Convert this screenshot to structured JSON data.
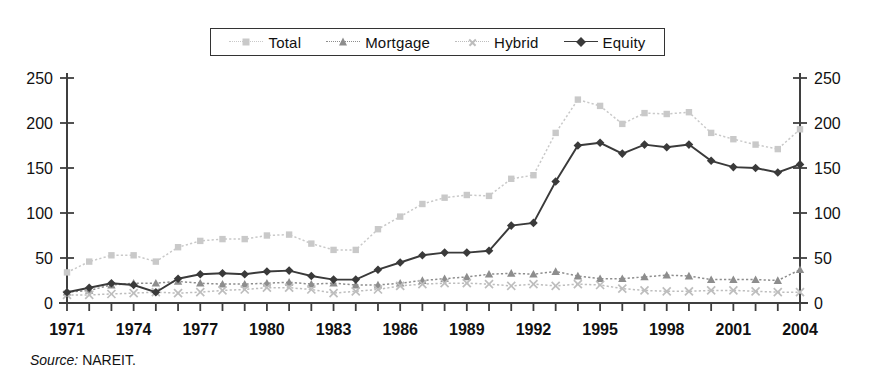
{
  "legend": {
    "items": [
      {
        "label": "Total",
        "marker": "square-marker",
        "color": "#c9c9c9",
        "line": "dotted"
      },
      {
        "label": "Mortgage",
        "marker": "triangle-marker",
        "color": "#8d8d8d",
        "line": "dotted"
      },
      {
        "label": "Hybrid",
        "marker": "x-marker",
        "color": "#bdbdbd",
        "line": "dotted"
      },
      {
        "label": "Equity",
        "marker": "diamond-marker",
        "color": "#3a3a3a",
        "line": "solid"
      }
    ]
  },
  "source": {
    "prefix": "Source:",
    "text": "NAREIT."
  },
  "axes": {
    "left_ticks": [
      "0",
      "50",
      "100",
      "150",
      "200",
      "250"
    ],
    "right_ticks": [
      "0",
      "50",
      "100",
      "150",
      "200",
      "250"
    ],
    "x_ticks": [
      "1971",
      "1974",
      "1977",
      "1980",
      "1983",
      "1986",
      "1989",
      "1992",
      "1995",
      "1998",
      "2001",
      "2004"
    ]
  },
  "chart_data": {
    "type": "line",
    "title": "",
    "xlabel": "",
    "ylabel": "",
    "ylim": [
      0,
      250
    ],
    "ytick_step": 50,
    "grid": false,
    "legend_position": "top-center",
    "dual_axis": true,
    "x": [
      1971,
      1972,
      1973,
      1974,
      1975,
      1976,
      1977,
      1978,
      1979,
      1980,
      1981,
      1982,
      1983,
      1984,
      1985,
      1986,
      1987,
      1988,
      1989,
      1990,
      1991,
      1992,
      1993,
      1994,
      1995,
      1996,
      1997,
      1998,
      1999,
      2000,
      2001,
      2002,
      2003,
      2004
    ],
    "series": [
      {
        "name": "Total",
        "color": "#c9c9c9",
        "marker": "square-marker",
        "line": "dotted",
        "values": [
          34,
          46,
          53,
          53,
          46,
          62,
          69,
          71,
          71,
          75,
          76,
          66,
          59,
          59,
          82,
          96,
          110,
          117,
          120,
          119,
          138,
          142,
          189,
          226,
          219,
          199,
          211,
          210,
          212,
          189,
          182,
          176,
          171,
          193
        ]
      },
      {
        "name": "Mortgage",
        "color": "#8d8d8d",
        "marker": "triangle-marker",
        "line": "dotted",
        "values": [
          12,
          14,
          20,
          22,
          22,
          24,
          22,
          21,
          21,
          22,
          23,
          21,
          22,
          20,
          20,
          22,
          25,
          27,
          29,
          32,
          33,
          32,
          35,
          30,
          27,
          27,
          29,
          31,
          30,
          26,
          26,
          26,
          25,
          37
        ]
      },
      {
        "name": "Hybrid",
        "color": "#bdbdbd",
        "marker": "x-marker",
        "line": "dotted",
        "values": [
          9,
          9,
          10,
          11,
          12,
          11,
          12,
          14,
          15,
          17,
          17,
          15,
          11,
          13,
          15,
          19,
          21,
          22,
          22,
          21,
          19,
          21,
          19,
          21,
          20,
          16,
          14,
          13,
          13,
          14,
          14,
          13,
          12,
          12
        ]
      },
      {
        "name": "Equity",
        "color": "#3a3a3a",
        "marker": "diamond-marker",
        "line": "solid",
        "values": [
          12,
          17,
          22,
          20,
          12,
          27,
          32,
          33,
          32,
          35,
          36,
          30,
          26,
          26,
          37,
          45,
          53,
          56,
          56,
          58,
          86,
          89,
          135,
          175,
          178,
          166,
          176,
          173,
          176,
          158,
          151,
          150,
          145,
          154
        ]
      }
    ]
  }
}
